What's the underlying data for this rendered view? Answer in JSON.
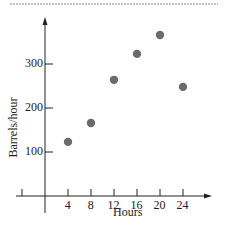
{
  "chart_data": {
    "type": "scatter",
    "title": "",
    "xlabel": "Hours",
    "ylabel": "Barrels/hour",
    "x_ticks": [
      4,
      8,
      12,
      16,
      20,
      24
    ],
    "y_ticks": [
      100,
      200,
      300
    ],
    "xlim": [
      -4,
      29
    ],
    "ylim": [
      0,
      400
    ],
    "grid": false,
    "legend": null,
    "points": [
      {
        "x": 4,
        "y": 123
      },
      {
        "x": 8,
        "y": 166
      },
      {
        "x": 12,
        "y": 264
      },
      {
        "x": 16,
        "y": 323
      },
      {
        "x": 20,
        "y": 366
      },
      {
        "x": 24,
        "y": 248
      }
    ],
    "point_color": "#6b6b6b",
    "axis_color": "#222222"
  }
}
